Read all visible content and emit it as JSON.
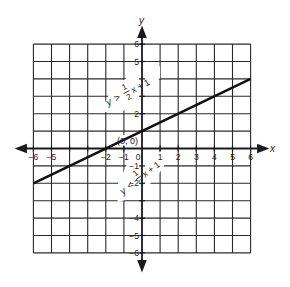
{
  "chart_data": {
    "type": "line",
    "title": "",
    "xlabel": "x",
    "ylabel": "y",
    "xlim": [
      -6,
      6
    ],
    "ylim": [
      -6,
      6
    ],
    "grid": true,
    "x_ticks": [
      -6,
      -5,
      -2,
      -1,
      0,
      1,
      2,
      3,
      4,
      5,
      6
    ],
    "x_tick_labels": [
      "−6",
      "−5",
      "−2",
      "−1",
      "0",
      "1",
      "2",
      "3",
      "4",
      "5",
      "6"
    ],
    "y_ticks": [
      6,
      5,
      2,
      -1,
      -2,
      -4,
      -5,
      -6
    ],
    "y_tick_labels": [
      "6",
      "5",
      "2",
      "−1",
      "−2",
      "−4",
      "−5",
      "−6"
    ],
    "series": [
      {
        "name": "y = 1/2 x + 1",
        "equation": "y = 1/2 x + 1",
        "slope": 0.5,
        "intercept": 1,
        "x": [
          -6,
          6
        ],
        "y": [
          -2,
          4
        ]
      }
    ],
    "annotations": [
      {
        "text": "(0, 0)",
        "x": 0,
        "y": 0,
        "role": "origin-label"
      },
      {
        "text": "y > 1/2 x + 1",
        "role": "region-above-line"
      },
      {
        "text": "y < 1/2 x + 1",
        "role": "region-below-line"
      }
    ],
    "legend": "none"
  },
  "labels": {
    "x_axis": "x",
    "y_axis": "y",
    "origin": "(0, 0)",
    "upper": {
      "y": "y",
      "op": ">",
      "num": "1",
      "den": "2",
      "rest": "x + 1"
    },
    "lower": {
      "y": "y",
      "op": "<",
      "num": "1",
      "den": "2",
      "rest": "x + 1"
    }
  }
}
